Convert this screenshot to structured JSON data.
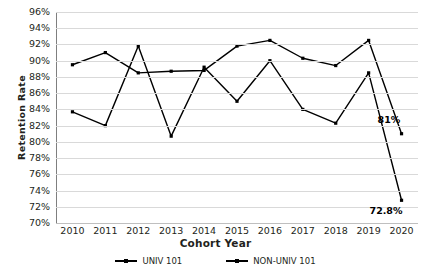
{
  "chart_data": {
    "type": "line",
    "title": "",
    "xlabel": "Cohort Year",
    "ylabel": "Retention Rate",
    "categories": [
      "2010",
      "2011",
      "2012",
      "2013",
      "2014",
      "2015",
      "2016",
      "2017",
      "2018",
      "2019",
      "2020"
    ],
    "ylim": [
      70,
      96
    ],
    "ytick_labels": [
      "96%",
      "94%",
      "92%",
      "90%",
      "88%",
      "86%",
      "84%",
      "82%",
      "80%",
      "78%",
      "76%",
      "74%",
      "72%",
      "70%"
    ],
    "ytick_values": [
      96,
      94,
      92,
      90,
      88,
      86,
      84,
      82,
      80,
      78,
      76,
      74,
      72,
      70
    ],
    "grid": true,
    "legend_position": "bottom",
    "series": [
      {
        "name": "UNIV 101",
        "values": [
          89.5,
          91.0,
          88.5,
          88.7,
          88.8,
          91.8,
          92.5,
          90.3,
          89.4,
          92.5,
          81.0
        ]
      },
      {
        "name": "NON-UNIV 101",
        "values": [
          83.7,
          82.0,
          91.8,
          80.7,
          89.2,
          85.0,
          90.0,
          84.0,
          82.3,
          88.5,
          72.8
        ]
      }
    ],
    "annotations": [
      {
        "text": "81%",
        "series": "UNIV 101",
        "category": "2020",
        "value": 81.0
      },
      {
        "text": "72.8%",
        "series": "NON-UNIV 101",
        "category": "2020",
        "value": 72.8
      }
    ]
  }
}
